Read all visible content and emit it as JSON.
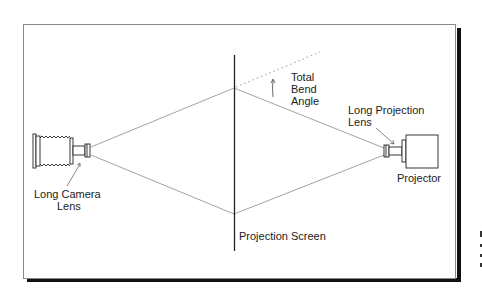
{
  "diagram": {
    "type": "optical-setup",
    "labels": {
      "camera_lens": [
        "Long Camera",
        "Lens"
      ],
      "bend_angle": [
        "Total",
        "Bend",
        "Angle"
      ],
      "projection_lens": [
        "Long Projection",
        "Lens"
      ],
      "projector": "Projector",
      "screen": "Projection Screen"
    },
    "colors": {
      "background": "#ffffff",
      "frame": "#888888",
      "shadow": "#111111",
      "ink": "#222222",
      "rays": "#777777",
      "dotted": "#999999"
    }
  }
}
